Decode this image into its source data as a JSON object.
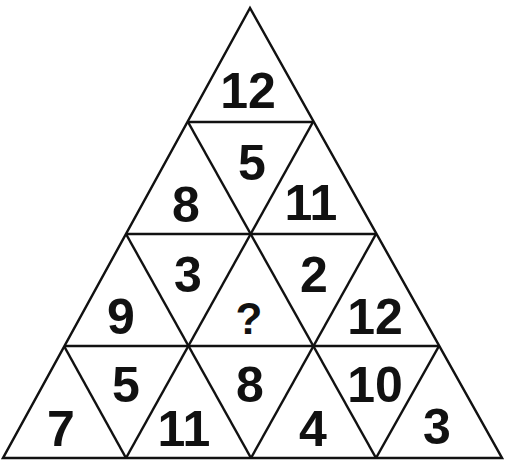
{
  "puzzle": {
    "rows": [
      {
        "cells": [
          "12"
        ]
      },
      {
        "cells": [
          "8",
          "5",
          "11"
        ]
      },
      {
        "cells": [
          "9",
          "3",
          "?",
          "2",
          "12"
        ]
      },
      {
        "cells": [
          "7",
          "5",
          "11",
          "8",
          "4",
          "10",
          "3"
        ]
      }
    ],
    "missing": "?",
    "line_color": "#111111",
    "background": "#ffffff"
  }
}
